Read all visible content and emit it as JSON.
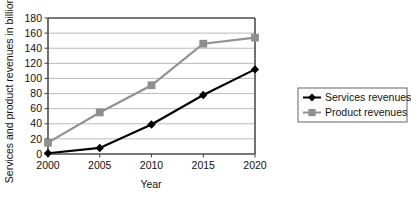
{
  "chart_data": {
    "type": "line",
    "title": "",
    "xlabel": "Year",
    "ylabel": "Services and product revenues in billion €",
    "categories": [
      "2000",
      "2005",
      "2010",
      "2015",
      "2020"
    ],
    "x": [
      2000,
      2005,
      2010,
      2015,
      2020
    ],
    "series": [
      {
        "name": "Services revenues",
        "values": [
          1,
          8,
          39,
          78,
          112
        ],
        "color": "#000000",
        "marker": "diamond"
      },
      {
        "name": "Product revenues",
        "values": [
          15,
          55,
          91,
          146,
          154
        ],
        "color": "#8f8f8f",
        "marker": "square"
      }
    ],
    "ylim": [
      0,
      180
    ],
    "ytick_labels": [
      "0",
      "20",
      "40",
      "60",
      "80",
      "100",
      "120",
      "140",
      "160",
      "180"
    ],
    "ytick_values": [
      0,
      20,
      40,
      60,
      80,
      100,
      120,
      140,
      160,
      180
    ],
    "xtick_labels": [
      "2000",
      "2005",
      "2010",
      "2015",
      "2020"
    ],
    "grid": true,
    "grid_axis": "y",
    "legend_position": "right-outside",
    "legend_entries": [
      "Services revenues",
      "Product revenues"
    ]
  },
  "axes": {
    "y_title": "Services and product revenues in billion €",
    "x_title": "Year"
  },
  "legend": {
    "items": [
      {
        "label": "Services revenues"
      },
      {
        "label": "Product revenues"
      }
    ]
  }
}
